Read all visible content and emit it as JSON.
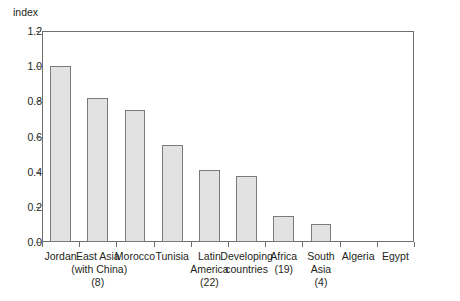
{
  "chart_data": {
    "type": "bar",
    "title": "",
    "subtitle": "",
    "xlabel": "",
    "ylabel": "index",
    "ylim": [
      0.0,
      1.2
    ],
    "ytick_values": [
      0.0,
      0.2,
      0.4,
      0.6,
      0.8,
      1.0,
      1.2
    ],
    "ytick_labels": [
      "0.0",
      "0.2",
      "0.4",
      "0.6",
      "0.8",
      "1.0",
      "1.2"
    ],
    "grid": false,
    "legend": "none",
    "bar_fill_color": "#e2e2e2",
    "bar_border_color": "#7a7a7a",
    "axis_color": "#6f6f6f",
    "categories": [
      "Jordan",
      "East Asia (with China) (8)",
      "Morocco",
      "Tunisia",
      "Latin America (22)",
      "Developing countries",
      "Africa (19)",
      "South Asia (4)",
      "Algeria",
      "Egypt"
    ],
    "category_label_lines": [
      [
        "Jordan"
      ],
      [
        "East Asia",
        "(with China)",
        "(8)"
      ],
      [
        "Morocco"
      ],
      [
        "Tunisia"
      ],
      [
        "Latin",
        "America",
        "(22)"
      ],
      [
        "Developing",
        "countries"
      ],
      [
        "Africa",
        "(19)"
      ],
      [
        "South",
        "Asia",
        "(4)"
      ],
      [
        "Algeria"
      ],
      [
        "Egypt"
      ]
    ],
    "values": [
      1.0,
      0.82,
      0.75,
      0.55,
      0.41,
      0.375,
      0.15,
      0.1,
      0.0,
      0.0
    ]
  }
}
